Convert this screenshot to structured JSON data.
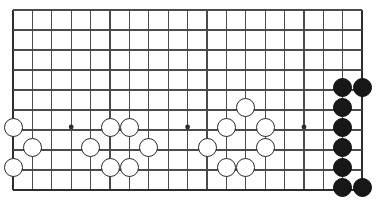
{
  "app": {
    "title": "Go Board Position",
    "kind": "go-board-diagram"
  },
  "board": {
    "width_px": 377,
    "height_px": 202,
    "line_color": "#4a4a4a",
    "edge_color": "#2e2e2e",
    "background_color": "#ffffff",
    "origin_x": 13,
    "origin_y": 10,
    "col_spacing": 19.4,
    "row_spacing": 20,
    "cols": 19,
    "rows": 10,
    "cropped": true,
    "crop_note": "lower portion of a 19x19 board; top rows cut off",
    "line_width": 1.1,
    "edge_line_width": 2.2,
    "stone_radius_px": 9.5,
    "star_point_radius_px": 2.4,
    "star_points": [
      {
        "col": 3,
        "row": 5.85
      },
      {
        "col": 9,
        "row": 5.85
      },
      {
        "col": 15,
        "row": 5.85
      }
    ],
    "edges": {
      "left": true,
      "right": true,
      "bottom": true,
      "top": false
    }
  },
  "stones": {
    "white_color": "#ffffff",
    "white_outline": "#2a2a2a",
    "black_color": "#171717",
    "black_outline": "#0d0d0d",
    "white_count": 16,
    "black_count": 8,
    "white": [
      {
        "col": 0,
        "row": 5.85
      },
      {
        "col": 0,
        "row": 7.85
      },
      {
        "col": 1,
        "row": 6.85
      },
      {
        "col": 4,
        "row": 6.85
      },
      {
        "col": 5,
        "row": 5.85
      },
      {
        "col": 6,
        "row": 5.85
      },
      {
        "col": 5,
        "row": 7.85
      },
      {
        "col": 6,
        "row": 7.85
      },
      {
        "col": 7,
        "row": 6.85
      },
      {
        "col": 10,
        "row": 6.85
      },
      {
        "col": 11,
        "row": 5.85
      },
      {
        "col": 11,
        "row": 7.85
      },
      {
        "col": 12,
        "row": 4.85
      },
      {
        "col": 12,
        "row": 7.85
      },
      {
        "col": 13,
        "row": 5.85
      },
      {
        "col": 13,
        "row": 6.85
      }
    ],
    "black": [
      {
        "col": 17,
        "row": 3.85
      },
      {
        "col": 17,
        "row": 4.85
      },
      {
        "col": 17,
        "row": 5.85
      },
      {
        "col": 17,
        "row": 6.85
      },
      {
        "col": 17,
        "row": 7.85
      },
      {
        "col": 17,
        "row": 8.85
      },
      {
        "col": 18,
        "row": 3.85
      },
      {
        "col": 18,
        "row": 8.85
      }
    ]
  }
}
